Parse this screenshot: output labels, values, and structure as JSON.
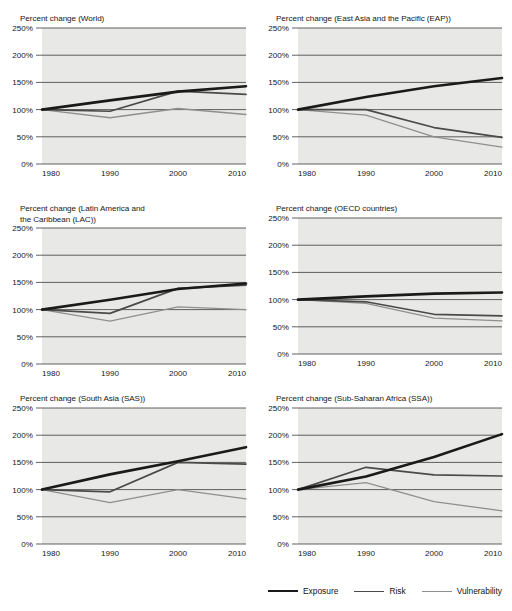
{
  "figure": {
    "background_color": "#ffffff",
    "plot_background_color": "#e8e8e6"
  },
  "legend": {
    "position": "bottom-right",
    "items": [
      {
        "label": "Exposure",
        "color": "#1a1a1a",
        "width": 2.6,
        "name": "exposure"
      },
      {
        "label": "Risk",
        "color": "#4a4a4a",
        "width": 1.7,
        "name": "risk"
      },
      {
        "label": "Vulnerability",
        "color": "#8f8f8f",
        "width": 1.3,
        "name": "vulnerability"
      }
    ]
  },
  "axis": {
    "x_ticks": [
      "1980",
      "1990",
      "2000",
      "2010"
    ],
    "x_values": [
      1980,
      1990,
      2000,
      2010
    ],
    "y_ticks": [
      "0%",
      "50%",
      "100%",
      "150%",
      "200%",
      "250%"
    ],
    "y_values": [
      0,
      50,
      100,
      150,
      200,
      250
    ],
    "ylim": [
      0,
      250
    ],
    "xlim": [
      1980,
      2010
    ],
    "grid": true
  },
  "chart_data": [
    {
      "type": "line",
      "panel": "world",
      "title": "Percent change (World)",
      "xlabel": "",
      "ylabel": "",
      "x": [
        1980,
        1990,
        2000,
        2010
      ],
      "xlim": [
        1980,
        2010
      ],
      "ylim": [
        0,
        250
      ],
      "grid": true,
      "legend_position": "shared-bottom",
      "series": [
        {
          "name": "Exposure",
          "values": [
            100,
            117,
            133,
            143
          ]
        },
        {
          "name": "Risk",
          "values": [
            100,
            97,
            134,
            128
          ]
        },
        {
          "name": "Vulnerability",
          "values": [
            100,
            85,
            102,
            91
          ]
        }
      ]
    },
    {
      "type": "line",
      "panel": "eap",
      "title": "Percent change (East Asia and the Pacific (EAP))",
      "xlabel": "",
      "ylabel": "",
      "x": [
        1980,
        1990,
        2000,
        2010
      ],
      "xlim": [
        1980,
        2010
      ],
      "ylim": [
        0,
        250
      ],
      "grid": true,
      "legend_position": "shared-bottom",
      "series": [
        {
          "name": "Exposure",
          "values": [
            100,
            123,
            143,
            158
          ]
        },
        {
          "name": "Risk",
          "values": [
            100,
            100,
            67,
            49
          ]
        },
        {
          "name": "Vulnerability",
          "values": [
            100,
            90,
            50,
            31
          ]
        }
      ]
    },
    {
      "type": "line",
      "panel": "lac",
      "title": "Percent change (Latin America and\nthe Caribbean (LAC))",
      "xlabel": "",
      "ylabel": "",
      "x": [
        1980,
        1990,
        2000,
        2010
      ],
      "xlim": [
        1980,
        2010
      ],
      "ylim": [
        0,
        250
      ],
      "grid": true,
      "legend_position": "shared-bottom",
      "series": [
        {
          "name": "Exposure",
          "values": [
            100,
            118,
            138,
            148
          ]
        },
        {
          "name": "Risk",
          "values": [
            100,
            93,
            139,
            145
          ]
        },
        {
          "name": "Vulnerability",
          "values": [
            100,
            79,
            105,
            100
          ]
        }
      ]
    },
    {
      "type": "line",
      "panel": "oecd",
      "title": "Percent change (OECD countries)",
      "xlabel": "",
      "ylabel": "",
      "x": [
        1980,
        1990,
        2000,
        2010
      ],
      "xlim": [
        1980,
        2010
      ],
      "ylim": [
        0,
        250
      ],
      "grid": true,
      "legend_position": "shared-bottom",
      "series": [
        {
          "name": "Exposure",
          "values": [
            100,
            106,
            111,
            113
          ]
        },
        {
          "name": "Risk",
          "values": [
            100,
            96,
            73,
            70
          ]
        },
        {
          "name": "Vulnerability",
          "values": [
            100,
            93,
            66,
            61
          ]
        }
      ]
    },
    {
      "type": "line",
      "panel": "sas",
      "title": "Percent change (South Asia (SAS))",
      "xlabel": "",
      "ylabel": "",
      "x": [
        1980,
        1990,
        2000,
        2010
      ],
      "xlim": [
        1980,
        2010
      ],
      "ylim": [
        0,
        250
      ],
      "grid": true,
      "legend_position": "shared-bottom",
      "series": [
        {
          "name": "Exposure",
          "values": [
            100,
            128,
            152,
            178
          ]
        },
        {
          "name": "Risk",
          "values": [
            100,
            96,
            150,
            147
          ]
        },
        {
          "name": "Vulnerability",
          "values": [
            100,
            76,
            100,
            83
          ]
        }
      ]
    },
    {
      "type": "line",
      "panel": "ssa",
      "title": "Percent change (Sub-Saharan Africa (SSA))",
      "xlabel": "",
      "ylabel": "",
      "x": [
        1980,
        1990,
        2000,
        2010
      ],
      "xlim": [
        1980,
        2010
      ],
      "ylim": [
        0,
        250
      ],
      "grid": true,
      "legend_position": "shared-bottom",
      "series": [
        {
          "name": "Exposure",
          "values": [
            100,
            124,
            160,
            202
          ]
        },
        {
          "name": "Risk",
          "values": [
            100,
            141,
            127,
            125
          ]
        },
        {
          "name": "Vulnerability",
          "values": [
            100,
            113,
            78,
            61
          ]
        }
      ]
    }
  ],
  "panel_layout": [
    {
      "key": "world",
      "left": 0,
      "top": 8,
      "title_lines": 1
    },
    {
      "key": "eap",
      "left": 256,
      "top": 8,
      "title_lines": 1
    },
    {
      "key": "lac",
      "left": 0,
      "top": 198,
      "title_lines": 2
    },
    {
      "key": "oecd",
      "left": 256,
      "top": 198,
      "title_lines": 1
    },
    {
      "key": "sas",
      "left": 0,
      "top": 388,
      "title_lines": 1
    },
    {
      "key": "ssa",
      "left": 256,
      "top": 388,
      "title_lines": 1
    }
  ]
}
